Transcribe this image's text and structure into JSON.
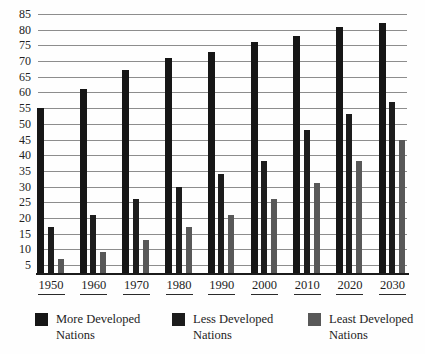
{
  "chart_data": {
    "type": "bar",
    "title": "",
    "categories": [
      "1950",
      "1960",
      "1970",
      "1980",
      "1990",
      "2000",
      "2010",
      "2020",
      "2030"
    ],
    "series": [
      {
        "key": "more",
        "name": "More Developed Nations",
        "color": "#161616",
        "values": [
          55,
          61,
          67,
          71,
          73,
          76,
          78,
          81,
          82
        ]
      },
      {
        "key": "less",
        "name": "Less Developed Nations",
        "color": "#1c1c1c",
        "values": [
          17,
          21,
          26,
          30,
          34,
          38,
          48,
          53,
          57
        ]
      },
      {
        "key": "least",
        "name": "Least Developed Nations",
        "color": "#585858",
        "values": [
          7,
          9,
          13,
          17,
          21,
          26,
          31,
          38,
          45
        ]
      }
    ],
    "xlabel": "",
    "ylabel": "",
    "y_axis": {
      "min": 5,
      "max": 85,
      "step": 5
    },
    "grid": true,
    "legend_position": "bottom"
  },
  "legend": {
    "items": [
      {
        "line1": "More Developed",
        "line2": "Nations"
      },
      {
        "line1": "Less Developed",
        "line2": "Nations"
      },
      {
        "line1": "Least Developed",
        "line2": "Nations"
      }
    ]
  }
}
